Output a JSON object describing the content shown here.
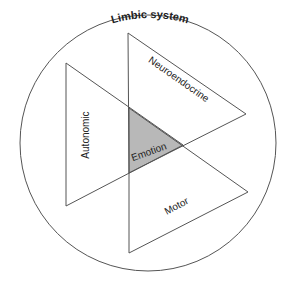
{
  "diagram": {
    "title": "Limbic system",
    "center_label": "Emotion",
    "triangles": [
      {
        "label": "Neuroendocrine"
      },
      {
        "label": "Autonomic"
      },
      {
        "label": "Motor"
      }
    ]
  },
  "colors": {
    "stroke": "#555555",
    "overlap_fill": "#b8b8b8",
    "background": "#ffffff"
  }
}
